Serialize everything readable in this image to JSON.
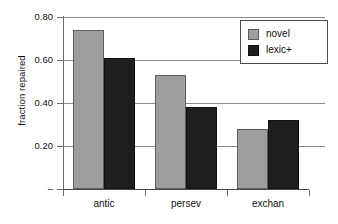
{
  "chart_data": {
    "type": "bar",
    "title": "",
    "xlabel": "",
    "ylabel": "fraction repaired",
    "categories": [
      "antic",
      "persev",
      "exchan"
    ],
    "series": [
      {
        "name": "novel",
        "color": "#9e9e9e",
        "values": [
          0.74,
          0.53,
          0.28
        ]
      },
      {
        "name": "lexic+",
        "color": "#1e1e1e",
        "values": [
          0.61,
          0.38,
          0.32
        ]
      }
    ],
    "ylim": [
      0.0,
      0.8
    ],
    "ytick_values": [
      0.8,
      0.6,
      0.4,
      0.2,
      0.0
    ],
    "ytick_labels": [
      "0.80",
      "0.60",
      "0.40",
      "0.20",
      "–"
    ],
    "grid": true,
    "legend_position": "top-right",
    "legend_entries": [
      "novel",
      "lexic+"
    ]
  },
  "axes": {
    "y_title": "fraction repaired",
    "ticks": [
      {
        "label": "0.80",
        "value": 0.8
      },
      {
        "label": "0.60",
        "value": 0.6
      },
      {
        "label": "0.40",
        "value": 0.4
      },
      {
        "label": "0.20",
        "value": 0.2
      },
      {
        "label": "–",
        "value": 0.0
      }
    ],
    "categories": [
      {
        "label": "antic"
      },
      {
        "label": "persev"
      },
      {
        "label": "exchan"
      }
    ]
  },
  "legend": {
    "items": [
      {
        "label": "novel",
        "color": "#9e9e9e"
      },
      {
        "label": "lexic+",
        "color": "#1e1e1e"
      }
    ]
  },
  "colors": {
    "novel": "#9e9e9e",
    "lexic": "#1e1e1e",
    "grid": "#8a8a8a",
    "axis": "#4a4a4a",
    "text": "#101010",
    "background": "#ffffff"
  }
}
